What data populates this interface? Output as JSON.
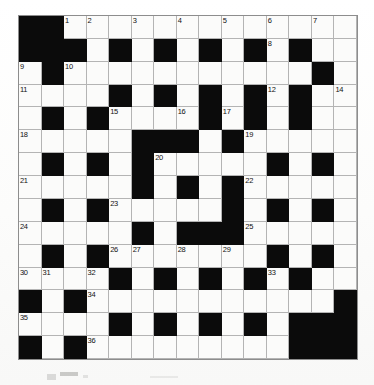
{
  "puzzle": {
    "type": "crossword-grid",
    "title": "Crossword Puzzle Grid",
    "rows": 15,
    "columns": 15,
    "colors": {
      "block": "#0b0b0b",
      "open": "#fbfbfa",
      "rule": "#b4b4b4",
      "number": "#111111"
    },
    "legend": {
      "block_symbol": "#",
      "open_symbol": "."
    },
    "grid": [
      "##.............",
      "###.#.#.#.#.#..",
      ".#...........#.",
      "....#.#.#.#.#..",
      ".#.#....#.#.#..",
      ".....###.#.....",
      ".#.#.#.....#.#.",
      ".....#.#.#.....",
      ".#.#.....#.#.#.",
      ".....#.###.....",
      ".#.#.......#.#.",
      "....#.#.#.#.#..",
      "#.#...........#",
      "....#.#.#.#.###",
      "#.#.........###"
    ],
    "numbers": [
      {
        "n": 1,
        "row": 1,
        "col": 3
      },
      {
        "n": 2,
        "row": 1,
        "col": 4
      },
      {
        "n": 3,
        "row": 1,
        "col": 6
      },
      {
        "n": 4,
        "row": 1,
        "col": 8
      },
      {
        "n": 5,
        "row": 1,
        "col": 10
      },
      {
        "n": 6,
        "row": 1,
        "col": 12
      },
      {
        "n": 7,
        "row": 1,
        "col": 14
      },
      {
        "n": 8,
        "row": 2,
        "col": 12
      },
      {
        "n": 9,
        "row": 3,
        "col": 1
      },
      {
        "n": 10,
        "row": 3,
        "col": 3
      },
      {
        "n": 11,
        "row": 4,
        "col": 1
      },
      {
        "n": 12,
        "row": 4,
        "col": 12
      },
      {
        "n": 13,
        "row": 4,
        "col": 13
      },
      {
        "n": 14,
        "row": 4,
        "col": 15
      },
      {
        "n": 15,
        "row": 5,
        "col": 5
      },
      {
        "n": 16,
        "row": 5,
        "col": 8
      },
      {
        "n": 17,
        "row": 5,
        "col": 10
      },
      {
        "n": 18,
        "row": 6,
        "col": 1
      },
      {
        "n": 19,
        "row": 6,
        "col": 11
      },
      {
        "n": 20,
        "row": 7,
        "col": 7
      },
      {
        "n": 21,
        "row": 8,
        "col": 1
      },
      {
        "n": 22,
        "row": 8,
        "col": 11
      },
      {
        "n": 23,
        "row": 9,
        "col": 5
      },
      {
        "n": 24,
        "row": 10,
        "col": 1
      },
      {
        "n": 25,
        "row": 10,
        "col": 11
      },
      {
        "n": 26,
        "row": 11,
        "col": 5
      },
      {
        "n": 27,
        "row": 11,
        "col": 6
      },
      {
        "n": 28,
        "row": 11,
        "col": 8
      },
      {
        "n": 29,
        "row": 11,
        "col": 10
      },
      {
        "n": 30,
        "row": 12,
        "col": 1
      },
      {
        "n": 31,
        "row": 12,
        "col": 2
      },
      {
        "n": 32,
        "row": 12,
        "col": 4
      },
      {
        "n": 33,
        "row": 12,
        "col": 12
      },
      {
        "n": 34,
        "row": 13,
        "col": 4
      },
      {
        "n": 35,
        "row": 14,
        "col": 1
      },
      {
        "n": 36,
        "row": 15,
        "col": 4
      }
    ]
  }
}
